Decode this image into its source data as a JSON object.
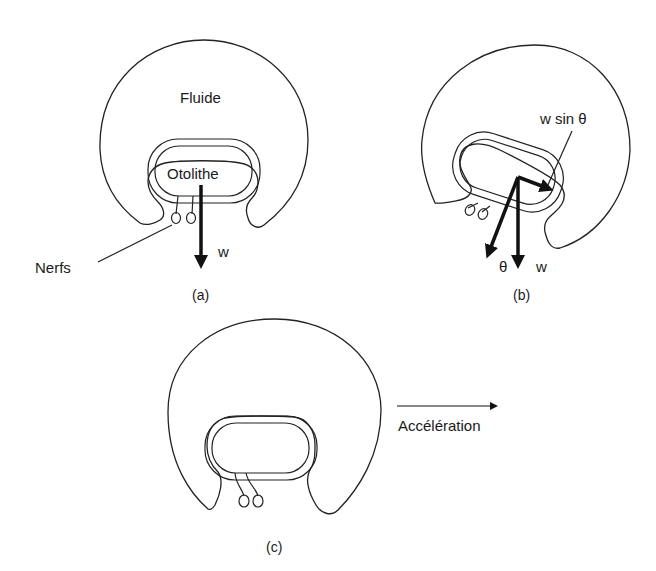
{
  "figure": {
    "panels": [
      {
        "id": "a",
        "caption": "(a)",
        "labels": {
          "fluid": "Fluide",
          "otolith": "Otolithe",
          "force": "w",
          "nerves": "Nerfs"
        }
      },
      {
        "id": "b",
        "caption": "(b)",
        "labels": {
          "component": "w sin θ",
          "angle": "θ",
          "force": "w"
        }
      },
      {
        "id": "c",
        "caption": "(c)",
        "labels": {
          "acceleration": "Accélération"
        }
      }
    ]
  }
}
